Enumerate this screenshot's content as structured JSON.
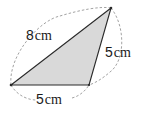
{
  "diagram": {
    "type": "triangle",
    "fill_color": "#d9d9d9",
    "stroke_color": "#2a2a2a",
    "arc_color": "#8a8a8a",
    "vertices": {
      "left": [
        11,
        85
      ],
      "bottom_right": [
        89,
        85
      ],
      "top": [
        111,
        8
      ]
    },
    "sides": [
      {
        "name": "left-to-top",
        "length_value": "8",
        "unit": "cm"
      },
      {
        "name": "bottom-right-to-top",
        "length_value": "5",
        "unit": "cm"
      },
      {
        "name": "left-to-bottom-right",
        "length_value": "5",
        "unit": "cm"
      }
    ]
  }
}
